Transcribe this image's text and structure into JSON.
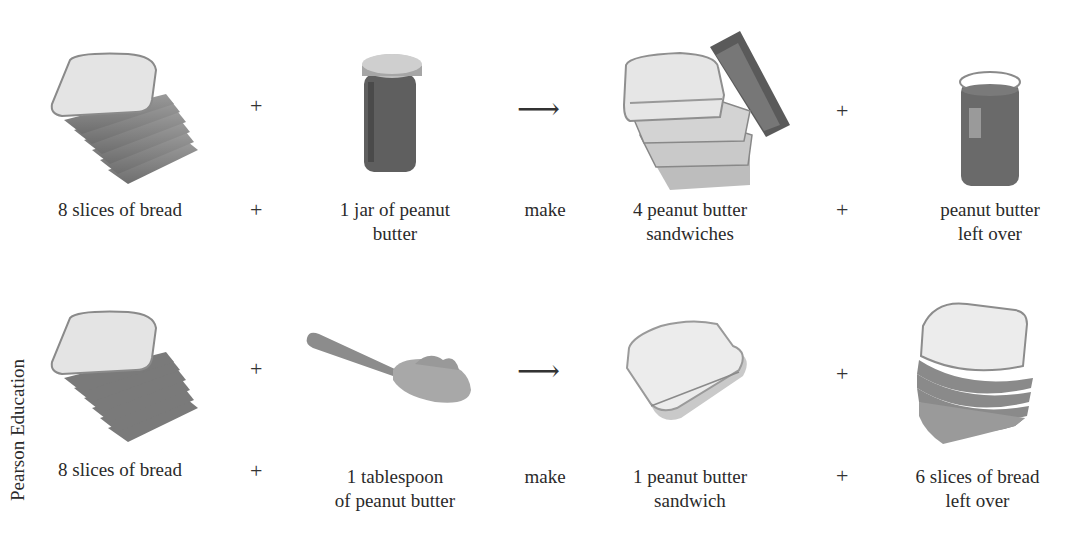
{
  "credit": "Pearson Education",
  "rows": [
    {
      "items": [
        {
          "label_lines": [
            "8 slices of bread"
          ],
          "icon": "bread-stack-icon"
        },
        {
          "label_lines": [
            "1 jar of peanut",
            "butter"
          ],
          "icon": "peanut-butter-jar-icon"
        },
        {
          "label_lines": [
            "4 peanut butter",
            "sandwiches"
          ],
          "icon": "sandwich-stack-icon"
        },
        {
          "label_lines": [
            "peanut butter",
            "left over"
          ],
          "icon": "open-jar-icon"
        }
      ],
      "operators": {
        "plus1": "+",
        "plus2": "+",
        "arrow": "⟶",
        "make": "make"
      }
    },
    {
      "items": [
        {
          "label_lines": [
            "8 slices of bread"
          ],
          "icon": "bread-stack-icon"
        },
        {
          "label_lines": [
            "1 tablespoon",
            "of peanut butter"
          ],
          "icon": "spoon-icon"
        },
        {
          "label_lines": [
            "1 peanut butter",
            "sandwich"
          ],
          "icon": "sandwich-icon"
        },
        {
          "label_lines": [
            "6 slices of bread",
            "left over"
          ],
          "icon": "bread-stack-icon"
        }
      ],
      "operators": {
        "plus1": "+",
        "plus2": "+",
        "arrow": "⟶",
        "make": "make"
      }
    }
  ]
}
